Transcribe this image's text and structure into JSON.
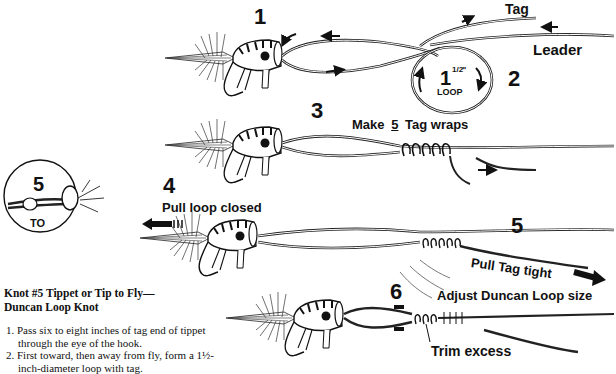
{
  "diagram": {
    "inset": {
      "number": "5",
      "label": "TO"
    },
    "steps": [
      {
        "id": "1",
        "number": "1"
      },
      {
        "id": "2",
        "number": "2"
      },
      {
        "id": "3",
        "number": "3"
      },
      {
        "id": "4",
        "number": "4"
      },
      {
        "id": "5",
        "number": "5"
      },
      {
        "id": "6",
        "number": "6"
      }
    ],
    "labels": {
      "tag": "Tag",
      "leader": "Leader",
      "loop_size": "1½\"",
      "loop_size_whole": "1",
      "loop_size_frac": "1/2",
      "loop_size_unit": "\"",
      "loop": "LOOP",
      "make_wraps_prefix": "Make",
      "make_wraps_count": "5",
      "make_wraps_suffix": "Tag wraps",
      "pull_loop_closed": "Pull loop closed",
      "pull_tag_tight": "Pull Tag tight",
      "adjust_loop": "Adjust Duncan Loop size",
      "trim_excess": "Trim excess"
    }
  },
  "caption": {
    "title_line1": "Knot #5 Tippet or Tip to Fly—",
    "title_line2": "Duncan Loop Knot",
    "instructions": [
      {
        "num": "1.",
        "text": "Pass six to eight inches of tag end of tippet through the eye of the hook."
      },
      {
        "num": "2.",
        "text": "First toward, then away from fly, form a 1½-inch-diameter loop with tag."
      }
    ]
  }
}
